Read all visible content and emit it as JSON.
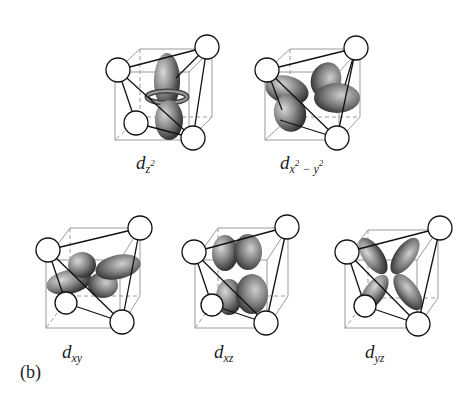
{
  "figure": {
    "part_label": "(b)",
    "orbitals": [
      {
        "id": "dz2",
        "base": "d",
        "subscript": "z",
        "superscript": "2",
        "tail": ""
      },
      {
        "id": "dx2-y2",
        "base": "d",
        "subscript": "x",
        "superscript": "2",
        "tail": " − y",
        "tail_sup": "2"
      },
      {
        "id": "dxy",
        "base": "d",
        "subscript": "xy"
      },
      {
        "id": "dxz",
        "base": "d",
        "subscript": "xz"
      },
      {
        "id": "dyz",
        "base": "d",
        "subscript": "yz"
      }
    ],
    "colors": {
      "lobe_dark": "#2a2a2a",
      "lobe_light": "#bdbdbd",
      "cube_line": "#999999",
      "bond_line": "#111111",
      "ligand_fill": "#ffffff"
    }
  }
}
